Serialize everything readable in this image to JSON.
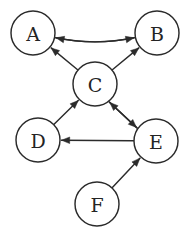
{
  "figure": {
    "type": "directed-graph",
    "title": "",
    "background_color": "#ffffff",
    "stroke_color": "#2b2b2b",
    "node_fill_color": "#ffffff",
    "width": 190,
    "height": 237
  },
  "graph_data": {
    "type": "directed-graph",
    "directed": true,
    "node_radius": 22,
    "nodes": [
      {
        "id": "A",
        "label": "A",
        "cx": 33,
        "cy": 33,
        "r": 22
      },
      {
        "id": "B",
        "label": "B",
        "cx": 157,
        "cy": 33,
        "r": 22
      },
      {
        "id": "C",
        "label": "C",
        "cx": 95,
        "cy": 84,
        "r": 22
      },
      {
        "id": "D",
        "label": "D",
        "cx": 38,
        "cy": 140,
        "r": 22
      },
      {
        "id": "E",
        "label": "E",
        "cx": 156,
        "cy": 141,
        "r": 22
      },
      {
        "id": "F",
        "label": "F",
        "cx": 97,
        "cy": 204,
        "r": 22
      }
    ],
    "edges": [
      {
        "from": "B",
        "to": "A",
        "style": "curved",
        "curvature": -1
      },
      {
        "from": "A",
        "to": "B",
        "style": "curved",
        "curvature": 1
      },
      {
        "from": "C",
        "to": "A",
        "style": "straight"
      },
      {
        "from": "C",
        "to": "B",
        "style": "straight"
      },
      {
        "from": "D",
        "to": "C",
        "style": "straight"
      },
      {
        "from": "E",
        "to": "C",
        "style": "parallel"
      },
      {
        "from": "C",
        "to": "E",
        "style": "parallel"
      },
      {
        "from": "E",
        "to": "D",
        "style": "straight"
      },
      {
        "from": "F",
        "to": "E",
        "style": "straight"
      }
    ]
  }
}
